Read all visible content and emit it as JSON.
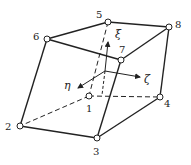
{
  "diagram": {
    "type": "hexahedral-element",
    "nodes": [
      {
        "id": "1",
        "x": 89,
        "y": 96,
        "lx": 86,
        "ly": 104
      },
      {
        "id": "2",
        "x": 20,
        "y": 126,
        "lx": 5,
        "ly": 122
      },
      {
        "id": "3",
        "x": 97,
        "y": 138,
        "lx": 93,
        "ly": 147
      },
      {
        "id": "4",
        "x": 160,
        "y": 97,
        "lx": 164,
        "ly": 99
      },
      {
        "id": "5",
        "x": 108,
        "y": 22,
        "lx": 96,
        "ly": 10
      },
      {
        "id": "6",
        "x": 47,
        "y": 39,
        "lx": 33,
        "ly": 32
      },
      {
        "id": "7",
        "x": 121,
        "y": 60,
        "lx": 119,
        "ly": 45
      },
      {
        "id": "8",
        "x": 169,
        "y": 27,
        "lx": 175,
        "ly": 20
      }
    ],
    "axes": [
      {
        "label": "ξ",
        "lx": 115,
        "ly": 29
      },
      {
        "label": "η",
        "lx": 64,
        "ly": 80
      },
      {
        "label": "ζ",
        "lx": 144,
        "ly": 74
      }
    ]
  }
}
